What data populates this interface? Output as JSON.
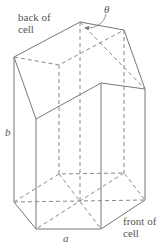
{
  "diagram": {
    "labels": {
      "back": [
        "back of",
        "cell"
      ],
      "front": [
        "front of",
        "cell"
      ],
      "b": "b",
      "a": "a",
      "theta": "θ"
    },
    "colors": {
      "line": "#777777",
      "text": "#555555"
    },
    "vertices": {
      "top": {
        "left": [
          14,
          57
        ],
        "back_left": [
          59,
          65
        ],
        "back_apex": [
          80,
          22
        ],
        "back_right": [
          124,
          30
        ],
        "right": [
          145,
          89
        ],
        "front_right": [
          101,
          83
        ],
        "front_left": [
          36,
          119
        ],
        "center": [
          80,
          60
        ]
      },
      "bottom": {
        "left": [
          14,
          202
        ],
        "back_left": [
          59,
          174
        ],
        "back_apex": [
          80,
          160
        ],
        "back_right": [
          124,
          173
        ],
        "right": [
          145,
          200
        ],
        "front_right": [
          101,
          229
        ],
        "front_left": [
          36,
          229
        ],
        "center": [
          80,
          201
        ]
      }
    }
  }
}
